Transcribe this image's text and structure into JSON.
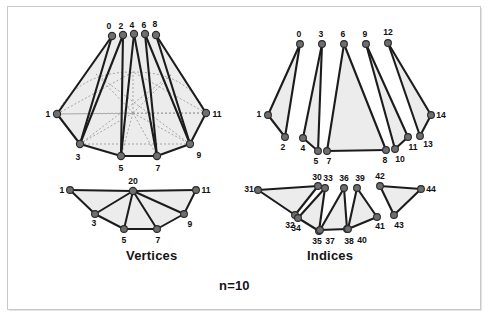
{
  "figure": {
    "caption_left": "Vertices",
    "caption_right": "Indices",
    "caption_bottom": "n=10",
    "colors": {
      "node_fill": "#6e6e6e",
      "node_stroke": "#2a2a2a",
      "edge": "#1c1c1c",
      "face_fill": "#e9e9e9",
      "dotted": "#9a9a9a",
      "frame": "#c9c9c9",
      "background": "#ffffff",
      "label": "#101010"
    }
  },
  "diagrams": {
    "vertices_cone": {
      "title": "Vertices",
      "apex_labels": [
        "0",
        "2",
        "4",
        "6",
        "8"
      ],
      "apex_points": [
        [
          112,
          36
        ],
        [
          123,
          35
        ],
        [
          134,
          34
        ],
        [
          145,
          34
        ],
        [
          156,
          35
        ]
      ],
      "ring_labels": [
        "1",
        "3",
        "5",
        "7",
        "9",
        "11"
      ],
      "ring_points": [
        [
          57,
          114
        ],
        [
          80,
          144
        ],
        [
          121,
          156
        ],
        [
          157,
          156
        ],
        [
          190,
          144
        ],
        [
          206,
          113
        ]
      ],
      "ring_label_offsets": [
        [
          -11,
          4
        ],
        [
          -3,
          13
        ],
        [
          0,
          14
        ],
        [
          0,
          14
        ],
        [
          8,
          12
        ],
        [
          11,
          4
        ]
      ],
      "center_point": [
        133,
        113
      ],
      "dotted_edges_note": "hidden base edges and spokes drawn dotted"
    },
    "vertices_fan": {
      "center_label": "20",
      "center_point": [
        133,
        191
      ],
      "ring_labels": [
        "1",
        "3",
        "5",
        "7",
        "9",
        "11"
      ],
      "ring_points": [
        [
          70,
          190
        ],
        [
          95,
          214
        ],
        [
          124,
          229
        ],
        [
          157,
          229
        ],
        [
          184,
          214
        ],
        [
          196,
          190
        ]
      ],
      "ring_label_offsets": [
        [
          -11,
          3
        ],
        [
          -2,
          12
        ],
        [
          0,
          13
        ],
        [
          0,
          13
        ],
        [
          7,
          12
        ],
        [
          10,
          3
        ]
      ]
    },
    "indices_cone": {
      "title": "Indices",
      "apex_labels": [
        "0",
        "3",
        "6",
        "9",
        "12"
      ],
      "apex_points": [
        [
          300,
          44
        ],
        [
          322,
          44
        ],
        [
          344,
          44
        ],
        [
          366,
          44
        ],
        [
          388,
          43
        ]
      ],
      "base_labels": [
        "1",
        "2",
        "4",
        "5",
        "7",
        "8",
        "10",
        "11",
        "13",
        "14"
      ],
      "base_points": [
        [
          268,
          115
        ],
        [
          285,
          137
        ],
        [
          303,
          138
        ],
        [
          318,
          151
        ],
        [
          327,
          151
        ],
        [
          386,
          150
        ],
        [
          395,
          149
        ],
        [
          408,
          137
        ],
        [
          420,
          136
        ],
        [
          431,
          115
        ]
      ],
      "base_label_offsets": [
        [
          -10,
          3
        ],
        [
          -2,
          12
        ],
        [
          0,
          12
        ],
        [
          -2,
          12
        ],
        [
          2,
          12
        ],
        [
          0,
          12
        ],
        [
          5,
          11
        ],
        [
          7,
          11
        ],
        [
          9,
          10
        ],
        [
          10,
          3
        ]
      ],
      "triangles": [
        {
          "apex": 0,
          "left": 0,
          "right": 1
        },
        {
          "apex": 1,
          "left": 2,
          "right": 3
        },
        {
          "apex": 2,
          "left": 4,
          "right": 5
        },
        {
          "apex": 3,
          "left": 6,
          "right": 7
        },
        {
          "apex": 4,
          "left": 8,
          "right": 9
        }
      ]
    },
    "indices_fan": {
      "triangles": [
        {
          "labels": [
            "31",
            "30",
            "32"
          ],
          "points": [
            [
              258,
              190
            ],
            [
              318,
              186
            ],
            [
              295,
              215
            ]
          ]
        },
        {
          "labels": [
            "33",
            "34",
            "35"
          ],
          "points": [
            [
              325,
              188
            ],
            [
              298,
              218
            ],
            [
              319,
              231
            ]
          ]
        },
        {
          "labels": [
            "36",
            "37",
            "38"
          ],
          "points": [
            [
              344,
              188
            ],
            [
              320,
              230
            ],
            [
              347,
              229
            ]
          ]
        },
        {
          "labels": [
            "39",
            "40",
            "41"
          ],
          "points": [
            [
              357,
              188
            ],
            [
              348,
              229
            ],
            [
              377,
              217
            ]
          ]
        },
        {
          "labels": [
            "42",
            "43",
            "44"
          ],
          "points": [
            [
              380,
              186
            ],
            [
              394,
              215
            ],
            [
              421,
              189
            ]
          ]
        }
      ],
      "label_offsets": [
        [
          [
            -11,
            3
          ],
          [
            -3,
            -5
          ],
          [
            -3,
            13
          ]
        ],
        [
          [
            -2,
            -5
          ],
          [
            -2,
            13
          ],
          [
            -2,
            13
          ]
        ],
        [
          [
            -2,
            -5
          ],
          [
            -3,
            13
          ],
          [
            2,
            13
          ]
        ],
        [
          [
            -2,
            -5
          ],
          [
            1,
            13
          ],
          [
            3,
            12
          ]
        ],
        [
          [
            -2,
            -5
          ],
          [
            3,
            12
          ],
          [
            9,
            3
          ]
        ]
      ]
    }
  }
}
